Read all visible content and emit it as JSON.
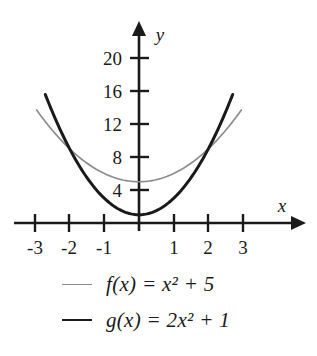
{
  "chart_data": {
    "type": "line",
    "title": "",
    "xlabel": "x",
    "ylabel": "y",
    "xlim": [
      -3.4,
      3.4
    ],
    "ylim": [
      0,
      21.5
    ],
    "grid": false,
    "legend_position": "below-plot",
    "x_ticks": [
      "-3",
      "-2",
      "-1",
      "1",
      "2",
      "3"
    ],
    "x_tick_values": [
      -3,
      -2,
      -1,
      1,
      2,
      3
    ],
    "y_ticks": [
      "4",
      "8",
      "12",
      "16",
      "20"
    ],
    "y_tick_values": [
      4,
      8,
      12,
      16,
      20
    ],
    "series": [
      {
        "name": "f(x) = x² + 5",
        "formula": "x^2 + 5",
        "color": "#8d8d8d",
        "style": "thin",
        "x": [
          -2.95,
          -2.5,
          -2,
          -1.5,
          -1,
          -0.5,
          0,
          0.5,
          1,
          1.5,
          2,
          2.5,
          2.95
        ],
        "values": [
          13.7,
          11.25,
          9,
          7.25,
          6,
          5.25,
          5,
          5.25,
          6,
          7.25,
          9,
          11.25,
          13.7
        ]
      },
      {
        "name": "g(x) = 2x² + 1",
        "formula": "2x^2 + 1",
        "color": "#1a1a1a",
        "style": "thick",
        "x": [
          -2.7,
          -2.25,
          -2,
          -1.5,
          -1,
          -0.5,
          0,
          0.5,
          1,
          1.5,
          2,
          2.25,
          2.7
        ],
        "values": [
          15.58,
          11.13,
          9,
          5.5,
          3,
          1.5,
          1,
          1.5,
          3,
          5.5,
          9,
          11.13,
          15.58
        ]
      }
    ],
    "intersections": [
      {
        "x": -2,
        "y": 9
      },
      {
        "x": 2,
        "y": 9
      }
    ]
  },
  "axes": {
    "x_axis_label": "x",
    "y_axis_label": "y"
  },
  "legend": {
    "entries": [
      {
        "label": "f(x) = x² + 5",
        "color": "#8d8d8d"
      },
      {
        "label": "g(x) = 2x² + 1",
        "color": "#1a1a1a"
      }
    ]
  }
}
